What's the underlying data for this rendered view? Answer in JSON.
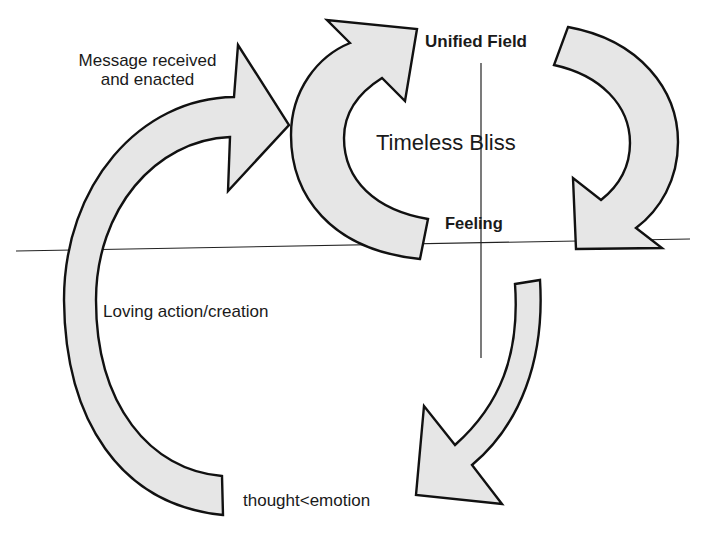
{
  "diagram": {
    "type": "cyclic-flow",
    "labels": {
      "message": "Message received and enacted",
      "message_line1": "Message received",
      "message_line2": "and enacted",
      "unified_field": "Unified Field",
      "timeless_bliss": "Timeless Bliss",
      "feeling": "Feeling",
      "loving_action": "Loving action/creation",
      "thought_emotion": "thought<emotion"
    },
    "arrows": [
      {
        "id": "loving-action-arrow",
        "from": "thought<emotion",
        "to": "Timeless Bliss",
        "direction": "up-right"
      },
      {
        "id": "timeless-cycle-arrow",
        "from": "Feeling",
        "to": "Unified Field",
        "direction": "up-right"
      },
      {
        "id": "unified-field-arrow",
        "from": "Unified Field",
        "to": "Feeling",
        "direction": "down"
      },
      {
        "id": "descending-arrow",
        "from": "Feeling",
        "to": "thought<emotion",
        "direction": "down-left"
      }
    ],
    "colors": {
      "arrow_fill": "#e6e6e6",
      "arrow_stroke": "#111111",
      "line": "#222222",
      "background": "#ffffff"
    }
  }
}
